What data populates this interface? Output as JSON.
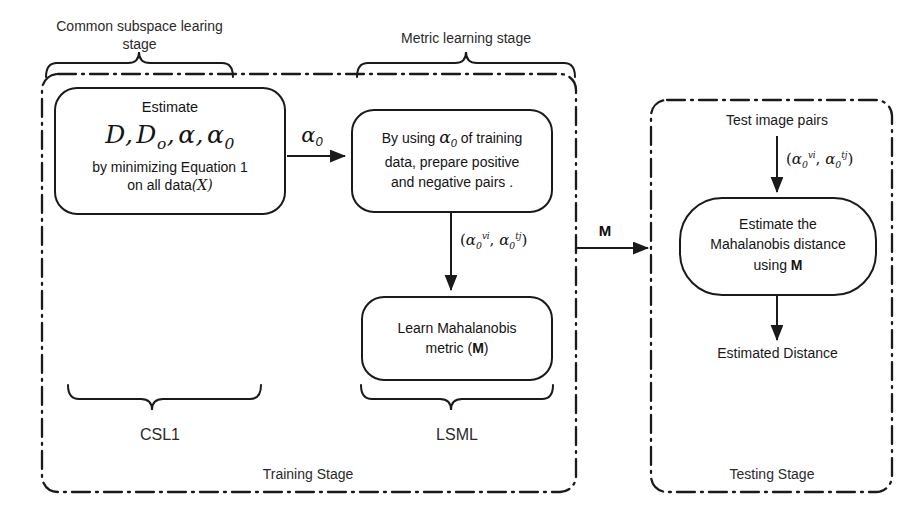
{
  "figure": {
    "type": "flow-diagram",
    "title_visible": false,
    "background": "#ffffff",
    "stroke_color": "#1a1a1a"
  },
  "braces": [
    {
      "id": "common-subspace",
      "label_line1": "Common subspace learing",
      "label_line2": "stage",
      "span": "box-estimate"
    },
    {
      "id": "metric-learning",
      "label_line1": "Metric learning stage",
      "label_line2": "",
      "span": "box-prepare-pairs"
    },
    {
      "id": "csl1",
      "label_line1": "CSL1",
      "label_line2": "",
      "span": "box-estimate"
    },
    {
      "id": "lsml",
      "label_line1": "LSML",
      "label_line2": "",
      "span": "box-learn-metric"
    }
  ],
  "containers": [
    {
      "id": "training-stage",
      "label": "Training Stage",
      "style": "dash-dot"
    },
    {
      "id": "testing-stage",
      "label": "Testing Stage",
      "style": "dash-dot"
    }
  ],
  "nodes": {
    "estimate": {
      "id": "box-estimate",
      "line1": "Estimate",
      "formula_plain": "D, D_o, α, α0",
      "formula_parts": {
        "D": "D",
        "Do": "D",
        "Do_sub": "o",
        "alpha": "α",
        "alpha0": "α",
        "alpha0_sub": "0"
      },
      "line3": "by minimizing Equation 1",
      "line4a": "on all data",
      "line4b": "(X)"
    },
    "prepare_pairs": {
      "id": "box-prepare-pairs",
      "line1a": "By using ",
      "line1_alpha": "α",
      "line1_sub": "0",
      "line1b": " of training",
      "line2": "data,  prepare positive",
      "line3": "and negative pairs ."
    },
    "learn_metric": {
      "id": "box-learn-metric",
      "line1": "Learn Mahalanobis",
      "line2a": "metric (",
      "line2b": "M",
      "line2c": ")"
    },
    "estimate_distance": {
      "id": "box-estimate-distance",
      "line1": "Estimate the",
      "line2": "Mahalanobis distance",
      "line3a": "using ",
      "line3b": "M"
    }
  },
  "free_text": {
    "test_image_pairs": "Test image pairs",
    "estimated_distance": "Estimated Distance"
  },
  "edges": [
    {
      "id": "edge-alpha0",
      "from": "box-estimate",
      "to": "box-prepare-pairs",
      "label_alpha": "α",
      "label_sub": "0",
      "direction": "right"
    },
    {
      "id": "edge-pairs-train",
      "from": "box-prepare-pairs",
      "to": "box-learn-metric",
      "label": "(α0^vi, α0^tj)",
      "direction": "down"
    },
    {
      "id": "edge-M",
      "from": "training-stage",
      "to": "box-estimate-distance",
      "label": "M",
      "direction": "right"
    },
    {
      "id": "edge-test-pairs",
      "from": "test-image-pairs",
      "to": "box-estimate-distance",
      "label": "(α0^vi, α0^tj)",
      "direction": "down"
    },
    {
      "id": "edge-result",
      "from": "box-estimate-distance",
      "to": "estimated-distance",
      "label": "",
      "direction": "down"
    }
  ],
  "pair_notation": {
    "open": "(",
    "a1": "α",
    "a1_sub": "0",
    "a1_sup": "vi",
    "comma": ", ",
    "a2": "α",
    "a2_sub": "0",
    "a2_sup": "tj",
    "close": ")"
  }
}
